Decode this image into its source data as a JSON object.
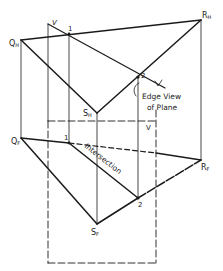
{
  "diagram": {
    "type": "descriptive-geometry",
    "labels": {
      "q_h": "Q",
      "q_h_sub": "H",
      "r_h": "R",
      "r_h_sub": "H",
      "s_h": "S",
      "s_h_sub": "H",
      "q_f": "Q",
      "q_f_sub": "F",
      "r_f": "R",
      "r_f_sub": "F",
      "s_f": "S",
      "s_f_sub": "F",
      "point_1_top": "1",
      "point_1_front": "1",
      "point_2_top": "2",
      "point_2_front": "2",
      "v_top": "V",
      "v_edge": "V",
      "v_front": "V",
      "edge_view_line1": "Edge View",
      "edge_view_line2": "of Plane",
      "intersection": "Intersection"
    },
    "colors": {
      "ink": "#1a1a1a",
      "background": "#ffffff"
    }
  }
}
